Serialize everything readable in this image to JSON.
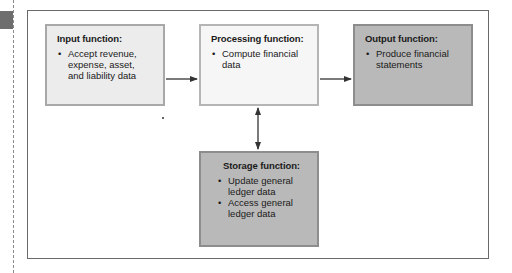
{
  "diagram": {
    "boxes": {
      "input": {
        "title": "Input function:",
        "bullets": [
          "Accept revenue, expense, asset, and liability data"
        ]
      },
      "processing": {
        "title": "Processing function:",
        "bullets": [
          "Compute financial data"
        ]
      },
      "output": {
        "title": "Output function:",
        "bullets": [
          "Produce financial statements"
        ]
      },
      "storage": {
        "title": "Storage function:",
        "bullets": [
          "Update general ledger data",
          "Access general ledger data"
        ]
      }
    },
    "connections": [
      {
        "from": "input",
        "to": "processing",
        "type": "one-way"
      },
      {
        "from": "processing",
        "to": "output",
        "type": "one-way"
      },
      {
        "from": "processing",
        "to": "storage",
        "type": "two-way"
      }
    ],
    "colors": {
      "input_fill": "#ececec",
      "processing_fill": "#f6f6f6",
      "output_fill": "#b9b9b9",
      "storage_fill": "#b9b9b9",
      "frame": "#6a6a6a",
      "arrow": "#333333"
    }
  }
}
